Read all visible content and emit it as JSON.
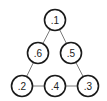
{
  "diagram": {
    "type": "triangle-graph",
    "nodes": [
      {
        "id": "n1",
        "label": ".1"
      },
      {
        "id": "n6",
        "label": ".6"
      },
      {
        "id": "n5",
        "label": ".5"
      },
      {
        "id": "n2",
        "label": ".2"
      },
      {
        "id": "n4",
        "label": ".4"
      },
      {
        "id": "n3",
        "label": ".3"
      }
    ],
    "edges": [
      {
        "from": "n1",
        "to": "n6"
      },
      {
        "from": "n1",
        "to": "n5"
      },
      {
        "from": "n6",
        "to": "n2"
      },
      {
        "from": "n5",
        "to": "n3"
      },
      {
        "from": "n2",
        "to": "n4"
      },
      {
        "from": "n4",
        "to": "n3"
      }
    ]
  }
}
